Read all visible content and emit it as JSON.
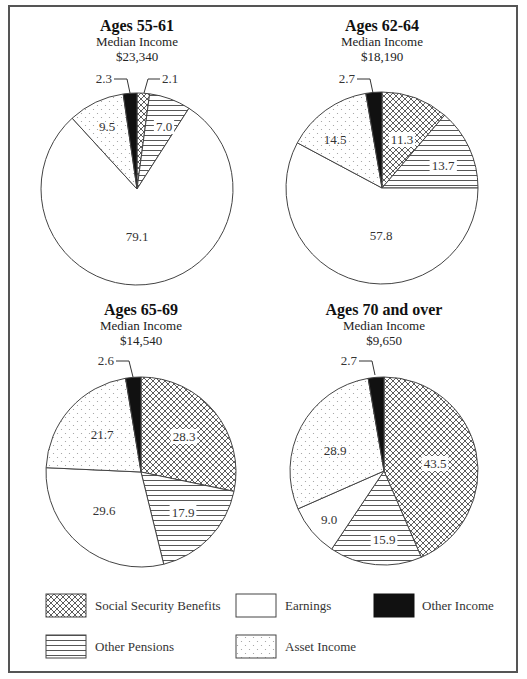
{
  "chart_data": {
    "type": "pie",
    "title": "",
    "legend": {
      "position": "bottom",
      "entries": [
        {
          "key": "social_security",
          "label": "Social Security Benefits",
          "pattern": "crosshatch"
        },
        {
          "key": "earnings",
          "label": "Earnings",
          "pattern": "white"
        },
        {
          "key": "other_income",
          "label": "Other Income",
          "pattern": "black"
        },
        {
          "key": "other_pensions",
          "label": "Other Pensions",
          "pattern": "horizontal-lines"
        },
        {
          "key": "asset_income",
          "label": "Asset Income",
          "pattern": "dots"
        }
      ]
    },
    "categories": [
      "Social Security Benefits",
      "Other Pensions",
      "Earnings",
      "Asset Income",
      "Other Income"
    ],
    "charts": [
      {
        "title": "Ages 55-61",
        "subtitle": "Median Income",
        "median_income": "$23,340",
        "values": {
          "social_security": 2.1,
          "other_pensions": 7.0,
          "earnings": 79.1,
          "asset_income": 9.5,
          "other_income": 2.3
        },
        "labels": {
          "social_security": "2.1",
          "other_pensions": "7.0",
          "earnings": "79.1",
          "asset_income": "9.5",
          "other_income": "2.3"
        }
      },
      {
        "title": "Ages 62-64",
        "subtitle": "Median Income",
        "median_income": "$18,190",
        "values": {
          "social_security": 11.3,
          "other_pensions": 13.7,
          "earnings": 57.8,
          "asset_income": 14.5,
          "other_income": 2.7
        },
        "labels": {
          "social_security": "11.3",
          "other_pensions": "13.7",
          "earnings": "57.8",
          "asset_income": "14.5",
          "other_income": "2.7"
        }
      },
      {
        "title": "Ages 65-69",
        "subtitle": "Median Income",
        "median_income": "$14,540",
        "values": {
          "social_security": 28.3,
          "other_pensions": 17.9,
          "earnings": 29.6,
          "asset_income": 21.7,
          "other_income": 2.6
        },
        "labels": {
          "social_security": "28.3",
          "other_pensions": "17.9",
          "earnings": "29.6",
          "asset_income": "21.7",
          "other_income": "2.6"
        }
      },
      {
        "title": "Ages 70 and over",
        "subtitle": "Median Income",
        "median_income": "$9,650",
        "values": {
          "social_security": 43.5,
          "other_pensions": 15.9,
          "earnings": 9.0,
          "asset_income": 28.9,
          "other_income": 2.7
        },
        "labels": {
          "social_security": "43.5",
          "other_pensions": "15.9",
          "earnings": "9.0",
          "asset_income": "28.9",
          "other_income": "2.7"
        }
      }
    ]
  },
  "colors": {
    "stroke": "#444444",
    "black_slice": "#111111",
    "dot": "#999999",
    "frame": "#555555"
  }
}
